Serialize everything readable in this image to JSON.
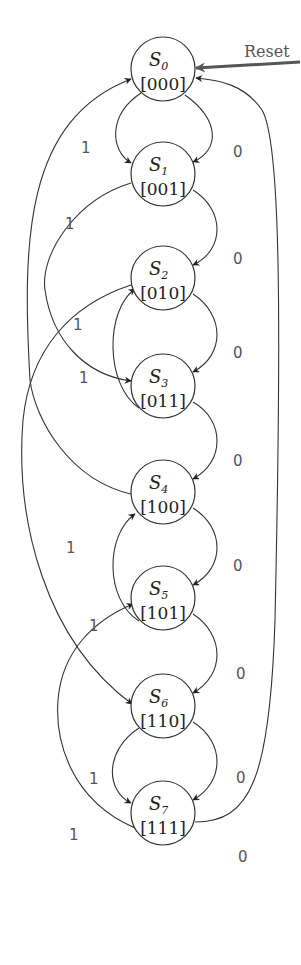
{
  "diagram": {
    "type": "finite-state-machine",
    "reset": {
      "label": "Reset",
      "target": "S0"
    },
    "states": [
      {
        "id": "S0",
        "name": "S",
        "sub": "0",
        "code": "[000]",
        "cx": 163,
        "cy": 69
      },
      {
        "id": "S1",
        "name": "S",
        "sub": "1",
        "code": "[001]",
        "cx": 163,
        "cy": 174
      },
      {
        "id": "S2",
        "name": "S",
        "sub": "2",
        "code": "[010]",
        "cx": 163,
        "cy": 278
      },
      {
        "id": "S3",
        "name": "S",
        "sub": "3",
        "code": "[011]",
        "cx": 163,
        "cy": 386
      },
      {
        "id": "S4",
        "name": "S",
        "sub": "4",
        "code": "[100]",
        "cx": 163,
        "cy": 492
      },
      {
        "id": "S5",
        "name": "S",
        "sub": "5",
        "code": "[101]",
        "cx": 163,
        "cy": 598
      },
      {
        "id": "S6",
        "name": "S",
        "sub": "6",
        "code": "[110]",
        "cx": 163,
        "cy": 706
      },
      {
        "id": "S7",
        "name": "S",
        "sub": "7",
        "code": "[111]",
        "cx": 163,
        "cy": 813
      }
    ],
    "transitions": [
      {
        "from": "S0",
        "to": "S1",
        "input": "0"
      },
      {
        "from": "S1",
        "to": "S2",
        "input": "0"
      },
      {
        "from": "S2",
        "to": "S3",
        "input": "0"
      },
      {
        "from": "S3",
        "to": "S4",
        "input": "0"
      },
      {
        "from": "S4",
        "to": "S5",
        "input": "0"
      },
      {
        "from": "S5",
        "to": "S6",
        "input": "0"
      },
      {
        "from": "S6",
        "to": "S7",
        "input": "0"
      },
      {
        "from": "S7",
        "to": "S0",
        "input": "0"
      },
      {
        "from": "S0",
        "to": "S1",
        "input": "1"
      },
      {
        "from": "S1",
        "to": "S3",
        "input": "1"
      },
      {
        "from": "S3",
        "to": "S2",
        "input": "1"
      },
      {
        "from": "S2",
        "to": "S6",
        "input": "1"
      },
      {
        "from": "S4",
        "to": "S0",
        "input": "1"
      },
      {
        "from": "S5",
        "to": "S4",
        "input": "1"
      },
      {
        "from": "S6",
        "to": "S7",
        "input": "1"
      },
      {
        "from": "S7",
        "to": "S5",
        "input": "1"
      }
    ],
    "edge_labels": [
      {
        "text": "0",
        "x": 233,
        "y": 157
      },
      {
        "text": "0",
        "x": 233,
        "y": 264
      },
      {
        "text": "0",
        "x": 233,
        "y": 358
      },
      {
        "text": "0",
        "x": 233,
        "y": 466
      },
      {
        "text": "0",
        "x": 233,
        "y": 571
      },
      {
        "text": "0",
        "x": 236,
        "y": 679
      },
      {
        "text": "0",
        "x": 236,
        "y": 783
      },
      {
        "text": "0",
        "x": 238,
        "y": 862
      },
      {
        "text": "1",
        "x": 81,
        "y": 153
      },
      {
        "text": "1",
        "x": 65,
        "y": 229
      },
      {
        "text": "1",
        "x": 73,
        "y": 330
      },
      {
        "text": "1",
        "x": 79,
        "y": 383
      },
      {
        "text": "1",
        "x": 66,
        "y": 553
      },
      {
        "text": "1",
        "x": 89,
        "y": 631
      },
      {
        "text": "1",
        "x": 89,
        "y": 784
      },
      {
        "text": "1",
        "x": 69,
        "y": 840
      }
    ]
  }
}
